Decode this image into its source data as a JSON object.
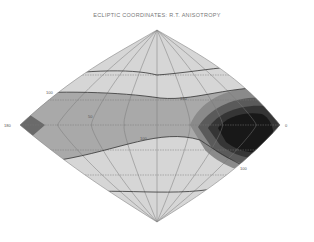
{
  "figure": {
    "title": "ECLIPTIC COORDINATES: R.T. ANISOTROPY",
    "projection": "sinusoidal",
    "left_axis_label": "180",
    "right_axis_label": "0",
    "contour_labels": [
      "100",
      "50",
      "100",
      "150",
      "100",
      "50"
    ]
  },
  "colors": {
    "background": "#ffffff",
    "band1": "#d9d9d9",
    "band2": "#b8b8b8",
    "band3": "#9a9a9a",
    "band4": "#6e6e6e",
    "band5": "#454545",
    "band6": "#1c1c1c",
    "grid": "#7a7a7a",
    "contour": "#333333"
  }
}
